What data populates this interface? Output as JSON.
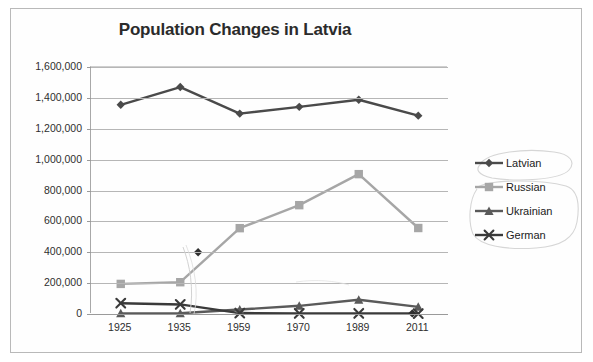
{
  "chart_data": {
    "type": "line",
    "title": "Population Changes in Latvia",
    "xlabel": "",
    "ylabel": "",
    "categories": [
      "1925",
      "1935",
      "1959",
      "1970",
      "1989",
      "2011"
    ],
    "ylim": [
      0,
      1600000
    ],
    "ytick_labels": [
      "0",
      "200,000",
      "400,000",
      "600,000",
      "800,000",
      "1,000,000",
      "1,200,000",
      "1,400,000",
      "1,600,000"
    ],
    "ytick_values": [
      0,
      200000,
      400000,
      600000,
      800000,
      1000000,
      1200000,
      1400000,
      1600000
    ],
    "grid": "horizontal",
    "legend_position": "right",
    "series": [
      {
        "name": "Latvian",
        "marker": "diamond",
        "color": "#4a4a4a",
        "values": [
          1355000,
          1470000,
          1298000,
          1342000,
          1388000,
          1285000
        ]
      },
      {
        "name": "Russian",
        "marker": "square",
        "color": "#a6a6a6",
        "values": [
          195000,
          206000,
          556000,
          705000,
          906000,
          557000
        ]
      },
      {
        "name": "Ukrainian",
        "marker": "triangle",
        "color": "#5a5a5a",
        "values": [
          4000,
          5000,
          29000,
          53000,
          92000,
          46000
        ]
      },
      {
        "name": "German",
        "marker": "x",
        "color": "#3a3a3a",
        "values": [
          70000,
          62000,
          6000,
          4000,
          4000,
          3000
        ]
      }
    ],
    "annotations": [
      {
        "name": "extra-point-400k",
        "label": "",
        "x_fraction": 0.3,
        "value": 400000,
        "note": "dark marker on Russian line segment between 1935 and 1959"
      },
      {
        "name": "extra-point-baseline",
        "label": "",
        "x_fraction": 0.9,
        "value": 4000,
        "note": "dark marker on baseline between 1989 and 2011"
      },
      {
        "name": "ink-curve",
        "label": "",
        "note": "faint hand-drawn vertical curve descending from the 400,000 marker"
      },
      {
        "name": "ink-oval-latvian",
        "label": "",
        "note": "hand-drawn oval circling the Latvian legend entry"
      },
      {
        "name": "ink-oval-others",
        "label": "",
        "note": "hand-drawn oval circling the Russian, Ukrainian and German legend entries"
      }
    ]
  },
  "legend": {
    "items": [
      {
        "label": "Latvian"
      },
      {
        "label": "Russian"
      },
      {
        "label": "Ukrainian"
      },
      {
        "label": "German"
      }
    ]
  },
  "colors": {
    "latvian": "#4a4a4a",
    "russian": "#a6a6a6",
    "ukrainian": "#5a5a5a",
    "german": "#3a3a3a",
    "grid": "#b6b6b6",
    "axis": "#9a9a9a",
    "title": "#2b2b2b",
    "page_border": "#b9b9b9",
    "ink": "#cfcfcf"
  }
}
